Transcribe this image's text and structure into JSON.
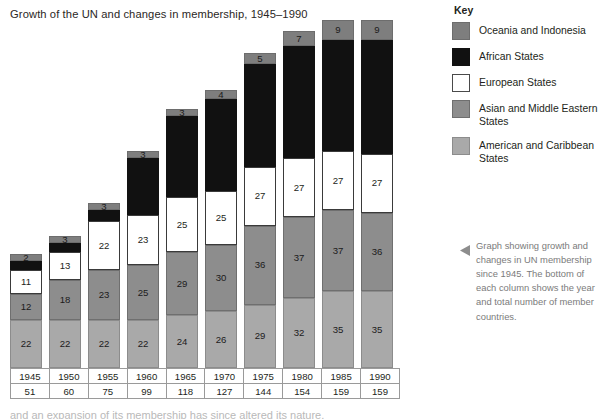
{
  "title": "Growth of the UN and changes in membership, 1945–1990",
  "key": {
    "heading": "Key",
    "items": [
      {
        "label": "Oceania and Indonesia",
        "color": "#7e7e7e",
        "swatch_class": "sw-oceania"
      },
      {
        "label": "African States",
        "color": "#111111",
        "swatch_class": "sw-african"
      },
      {
        "label": "European States",
        "color": "#ffffff",
        "swatch_class": "sw-european"
      },
      {
        "label": "Asian and Middle Eastern States",
        "color": "#8d8d8d",
        "swatch_class": "sw-asian"
      },
      {
        "label": "American and Caribbean States",
        "color": "#a9a9a9",
        "swatch_class": "sw-american"
      }
    ]
  },
  "caption": {
    "arrow_icon": "left-triangle-icon",
    "text": "Graph showing growth and changes in UN membership since 1945. The bottom of each column shows the year and total number of member countries."
  },
  "axis_table": {
    "years": [
      "1945",
      "1950",
      "1955",
      "1960",
      "1965",
      "1970",
      "1975",
      "1980",
      "1985",
      "1990"
    ],
    "totals": [
      "51",
      "60",
      "75",
      "99",
      "118",
      "127",
      "144",
      "154",
      "159",
      "159"
    ]
  },
  "below_figure_text": "and an expansion of its membership has since altered its nature.",
  "chart_data": {
    "type": "bar",
    "stacked": true,
    "title": "Growth of the UN and changes in membership, 1945–1990",
    "xlabel": "",
    "ylabel": "",
    "grid": false,
    "legend_position": "right",
    "ylim": [
      0,
      160
    ],
    "categories": [
      "1945",
      "1950",
      "1955",
      "1960",
      "1965",
      "1970",
      "1975",
      "1980",
      "1985",
      "1990"
    ],
    "totals": [
      51,
      60,
      75,
      99,
      118,
      127,
      144,
      154,
      159,
      159
    ],
    "series": [
      {
        "name": "American and Caribbean States",
        "color": "#a9a9a9",
        "seg_class": "seg-american",
        "values": [
          22,
          22,
          22,
          22,
          24,
          26,
          29,
          32,
          35,
          35
        ],
        "labels_visible": [
          true,
          true,
          true,
          true,
          true,
          true,
          true,
          true,
          true,
          true
        ]
      },
      {
        "name": "Asian and Middle Eastern States",
        "color": "#8d8d8d",
        "seg_class": "seg-asian",
        "values": [
          12,
          18,
          23,
          25,
          29,
          30,
          36,
          37,
          37,
          36
        ],
        "labels_visible": [
          true,
          true,
          true,
          true,
          true,
          true,
          true,
          true,
          true,
          true
        ]
      },
      {
        "name": "European States",
        "color": "#ffffff",
        "seg_class": "seg-european",
        "values": [
          11,
          13,
          22,
          23,
          25,
          25,
          27,
          27,
          27,
          27
        ],
        "labels_visible": [
          true,
          true,
          true,
          true,
          true,
          true,
          true,
          true,
          true,
          true
        ]
      },
      {
        "name": "African States",
        "color": "#111111",
        "seg_class": "seg-african",
        "values": [
          4,
          4,
          5,
          26,
          37,
          42,
          47,
          51,
          51,
          52
        ],
        "labels_visible": [
          false,
          false,
          false,
          false,
          false,
          false,
          false,
          false,
          false,
          false
        ]
      },
      {
        "name": "Oceania and Indonesia",
        "color": "#7e7e7e",
        "seg_class": "seg-oceania",
        "values": [
          2,
          3,
          3,
          3,
          3,
          4,
          5,
          7,
          9,
          9
        ],
        "labels_visible": [
          true,
          true,
          true,
          true,
          true,
          true,
          true,
          true,
          true,
          true
        ]
      }
    ]
  }
}
